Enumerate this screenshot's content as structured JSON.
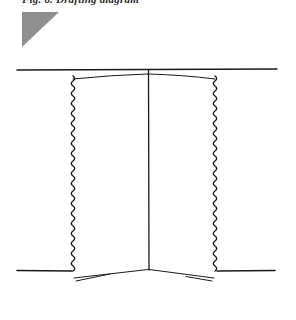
{
  "page": {
    "background_color": "#ffffff",
    "width": 296,
    "height": 320
  },
  "caption": {
    "text": "Fig. 6. Drafting diagram",
    "color": "#2b2b2b"
  },
  "triangle": {
    "name": "gray-right-triangle",
    "fill_color": "#8f8f8f",
    "orientation": "right-angle-top-left"
  },
  "figure": {
    "ink_color": "#1a1a1a",
    "elements": [
      {
        "name": "top-horizontal-rule",
        "kind": "line",
        "x1": 17,
        "y1": 70,
        "x2": 277,
        "y2": 69
      },
      {
        "name": "upper-sagging-line-left",
        "kind": "line",
        "x1": 73,
        "y1": 79,
        "x2": 148,
        "y2": 74
      },
      {
        "name": "upper-sagging-line-right",
        "kind": "line",
        "x1": 148,
        "y1": 74,
        "x2": 215,
        "y2": 79
      },
      {
        "name": "center-vertical-line",
        "kind": "line",
        "x1": 148,
        "y1": 70,
        "x2": 149,
        "y2": 270
      },
      {
        "name": "left-wavy-edge",
        "kind": "wave",
        "x": 73,
        "y1": 76,
        "y2": 281,
        "amplitude": 3.2,
        "wavelength": 10
      },
      {
        "name": "right-wavy-edge",
        "kind": "wave",
        "x": 215,
        "y1": 76,
        "y2": 281,
        "amplitude": 3.2,
        "wavelength": 10
      },
      {
        "name": "bottom-left-horizontal-stub",
        "kind": "line",
        "x1": 17,
        "y1": 270,
        "x2": 72,
        "y2": 271
      },
      {
        "name": "bottom-right-horizontal-stub",
        "kind": "line",
        "x1": 217,
        "y1": 271,
        "x2": 275,
        "y2": 270
      },
      {
        "name": "bottom-slant-left",
        "kind": "line",
        "x1": 74,
        "y1": 278,
        "x2": 148,
        "y2": 269
      },
      {
        "name": "bottom-slant-right",
        "kind": "line",
        "x1": 149,
        "y1": 269,
        "x2": 214,
        "y2": 278
      },
      {
        "name": "bottom-left-tail",
        "kind": "line",
        "x1": 76,
        "y1": 280,
        "x2": 108,
        "y2": 274
      },
      {
        "name": "bottom-right-tail",
        "kind": "line",
        "x1": 212,
        "y1": 280,
        "x2": 188,
        "y2": 276
      }
    ]
  }
}
